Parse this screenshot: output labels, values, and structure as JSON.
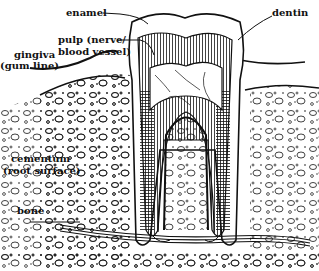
{
  "diagram": {
    "labels": {
      "enamel": "enamel",
      "dentin": "dentin",
      "pulp_line1": "pulp (nerve/",
      "pulp_line2": "blood vessel)",
      "gingiva_line1": "gingiva",
      "gingiva_line2": "(gum line)",
      "cementum_line1": "cementum",
      "cementum_line2": "(root surface)",
      "bone": "bone"
    },
    "colors": {
      "ink": "#111111",
      "background": "#ffffff"
    }
  }
}
